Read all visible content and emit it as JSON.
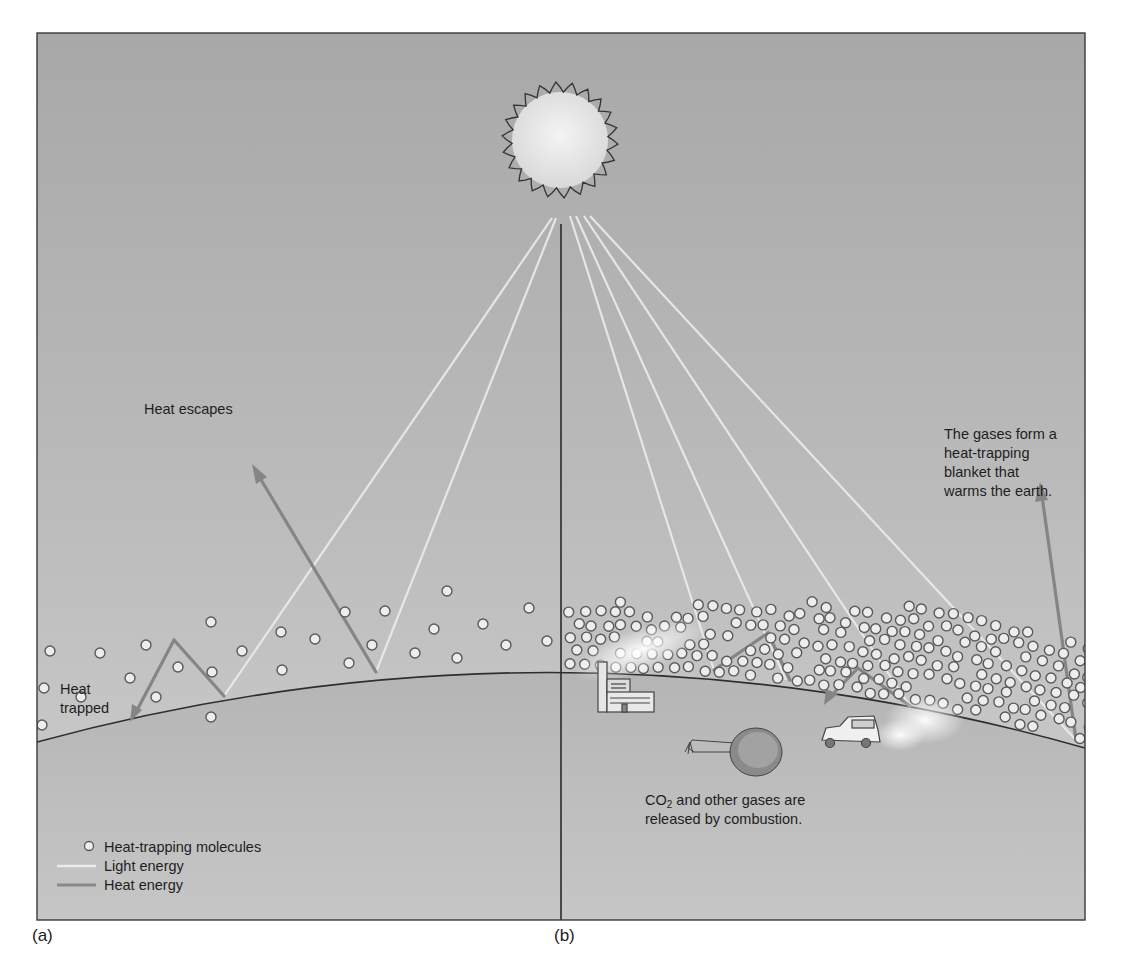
{
  "figure": {
    "panels": [
      {
        "id": "a",
        "label": "(a)"
      },
      {
        "id": "b",
        "label": "(b)"
      }
    ],
    "annotations": {
      "heat_escapes": "Heat escapes",
      "heat_trapped_line1": "Heat",
      "heat_trapped_line2": "trapped",
      "blanket_line1": "The gases form a",
      "blanket_line2": "heat-trapping",
      "blanket_line3": "blanket that",
      "blanket_line4": "warms the earth.",
      "combustion_line1_pre": "CO",
      "combustion_line1_sub": "2",
      "combustion_line1_post": " and other gases are",
      "combustion_line2": "released by combustion."
    },
    "legend": {
      "items": [
        {
          "symbol": "circle",
          "label": "Heat-trapping molecules"
        },
        {
          "symbol": "light-line",
          "label": "Light energy",
          "color": "#e8e8e8"
        },
        {
          "symbol": "heat-line",
          "label": "Heat energy",
          "color": "#8a8a8a"
        }
      ]
    },
    "colors": {
      "sky_top": "#a9a9a9",
      "sky_bottom": "#c9c9c9",
      "ground": "#bdbdbd",
      "light_ray": "#ececec",
      "heat_ray": "#858585",
      "molecule_fill": "#ededed",
      "molecule_stroke": "#555555",
      "outline": "#333333"
    }
  }
}
